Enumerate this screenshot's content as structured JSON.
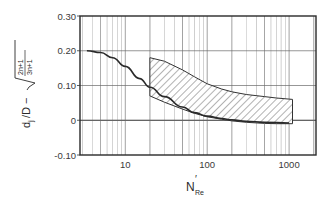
{
  "chart_data": {
    "type": "line",
    "title": "",
    "xlabel": "N'Re",
    "xlabel_main": "N",
    "xlabel_prime": "′",
    "xlabel_sub": "Re",
    "ylabel": "dj/D − √((2n+1)/(3n+1))",
    "ylabel_parts": {
      "d": "d",
      "j": "j",
      "over_d": "/D −",
      "frac_num": "2n+1",
      "frac_den": "3n+1"
    },
    "x_scale": "log",
    "xlim": [
      2.8,
      2130
    ],
    "ylim": [
      -0.1,
      0.3
    ],
    "x_ticks": [
      {
        "value": 10,
        "label": "10"
      },
      {
        "value": 100,
        "label": "100"
      },
      {
        "value": 1000,
        "label": "1000"
      }
    ],
    "y_ticks": [
      {
        "value": 0.3,
        "label": "0.30"
      },
      {
        "value": 0.2,
        "label": "0.20"
      },
      {
        "value": 0.1,
        "label": "0.10"
      },
      {
        "value": 0,
        "label": "0"
      },
      {
        "value": -0.1,
        "label": "-0.10"
      }
    ],
    "grid": true,
    "series": [
      {
        "name": "correlation curve",
        "style": "solid",
        "x": [
          3.4,
          5,
          7,
          10,
          15,
          20,
          30,
          50,
          70,
          100,
          150,
          200,
          300,
          500,
          1000
        ],
        "y": [
          0.2,
          0.195,
          0.18,
          0.155,
          0.12,
          0.095,
          0.068,
          0.038,
          0.022,
          0.012,
          0.005,
          0.001,
          -0.003,
          -0.006,
          -0.008
        ]
      }
    ],
    "bands": [
      {
        "name": "experimental data region",
        "style": "hatched",
        "x": [
          20,
          30,
          50,
          70,
          100,
          150,
          200,
          300,
          500,
          700,
          1100
        ],
        "y_upper": [
          0.18,
          0.17,
          0.145,
          0.125,
          0.105,
          0.09,
          0.082,
          0.074,
          0.068,
          0.064,
          0.06
        ],
        "y_lower": [
          0.07,
          0.052,
          0.032,
          0.02,
          0.01,
          0.003,
          -0.002,
          -0.006,
          -0.009,
          -0.01,
          -0.01
        ]
      }
    ]
  },
  "colors": {
    "line": "#2a2a2a",
    "grid": "#6a6a6a",
    "hatch": "#555555",
    "background": "#ffffff"
  }
}
